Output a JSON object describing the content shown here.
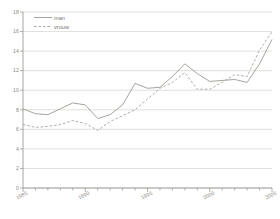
{
  "chart_data": {
    "type": "line",
    "title": "",
    "subtitle": "",
    "xlabel": "",
    "ylabel": "",
    "xlim": [
      1985,
      2005
    ],
    "ylim": [
      0,
      18
    ],
    "yticks": [
      0,
      2,
      4,
      6,
      8,
      10,
      12,
      14,
      16,
      18
    ],
    "ytick_labels": [
      "0",
      "2",
      "4",
      "6",
      "8",
      "10",
      "12",
      "14",
      "16",
      "18"
    ],
    "xticks": [
      1985,
      1990,
      1995,
      2000,
      2005
    ],
    "xtick_labels": [
      "1985",
      "1990",
      "1995",
      "2000",
      "2005"
    ],
    "x_minor_tick_step": 1,
    "grid": "horizontal",
    "legend_position": "top-left",
    "x": [
      1985,
      1986,
      1987,
      1988,
      1989,
      1990,
      1991,
      1992,
      1993,
      1994,
      1995,
      1996,
      1997,
      1998,
      1999,
      2000,
      2001,
      2002,
      2003,
      2004,
      2005
    ],
    "series": [
      {
        "name": "man",
        "style": "solid",
        "color": "#9a9a93",
        "values": [
          8.1,
          7.6,
          7.5,
          8.1,
          8.7,
          8.5,
          7.1,
          7.5,
          8.5,
          10.7,
          10.2,
          10.3,
          11.4,
          12.7,
          11.7,
          10.9,
          11.0,
          11.1,
          10.8,
          12.7,
          15.2
        ]
      },
      {
        "name": "vrouw",
        "style": "dashed",
        "color": "#a8a49c",
        "values": [
          6.5,
          6.2,
          6.3,
          6.5,
          6.9,
          6.6,
          5.9,
          6.8,
          7.4,
          8.0,
          9.1,
          10.2,
          10.8,
          11.8,
          10.1,
          10.1,
          10.8,
          11.6,
          11.4,
          14.1,
          16.0
        ]
      }
    ]
  },
  "legend": {
    "items": [
      {
        "label": "man"
      },
      {
        "label": "vrouw"
      }
    ]
  },
  "axes": {
    "y_labels": [
      "18",
      "16",
      "14",
      "12",
      "10",
      "8",
      "6",
      "4",
      "2",
      "0"
    ],
    "x_labels": [
      "1985",
      "1990",
      "1995",
      "2000",
      "2005"
    ]
  },
  "colors": {
    "grid": "#c9c9c4",
    "axis": "#8f8f8a",
    "tick_text": "#8a8a86",
    "series_man": "#9a9a93",
    "series_vrouw": "#a8a49c",
    "background": "#ffffff"
  }
}
